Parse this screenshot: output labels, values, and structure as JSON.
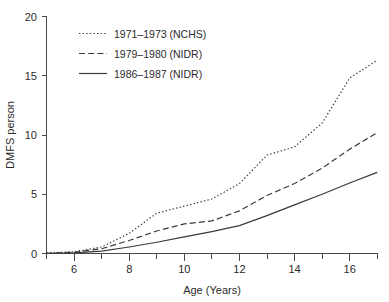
{
  "chart_data": {
    "type": "line",
    "title": "",
    "xlabel": "Age (Years)",
    "ylabel": "DMFS person",
    "xlim": [
      5,
      17
    ],
    "ylim": [
      0,
      20
    ],
    "grid": false,
    "legend_position": "top-left",
    "x_ticks_major": [
      6,
      8,
      10,
      12,
      14,
      16
    ],
    "x_ticks_minor": [
      5,
      7,
      9,
      11,
      13,
      15,
      17
    ],
    "x_tick_labels": [
      "6",
      "8",
      "10",
      "12",
      "14",
      "16"
    ],
    "y_ticks": [
      0,
      5,
      10,
      15,
      20
    ],
    "y_tick_labels": [
      "0",
      "5",
      "10",
      "15",
      "20"
    ],
    "x": [
      5,
      6,
      7,
      8,
      9,
      10,
      11,
      12,
      13,
      14,
      15,
      16,
      17
    ],
    "series": [
      {
        "name": "1971-1973 (NCHS)",
        "style": "dotted",
        "color": "#3a3a3a",
        "values": [
          0.05,
          0.15,
          0.55,
          1.7,
          3.4,
          4.0,
          4.6,
          5.9,
          8.3,
          9.0,
          11.0,
          14.8,
          16.3
        ]
      },
      {
        "name": "1979-1980 (NIDR)",
        "style": "dashed",
        "color": "#3a3a3a",
        "values": [
          0.02,
          0.1,
          0.4,
          1.1,
          1.9,
          2.5,
          2.75,
          3.6,
          4.9,
          5.9,
          7.2,
          8.8,
          10.2
        ]
      },
      {
        "name": "1986-1987 (NIDR)",
        "style": "solid",
        "color": "#3a3a3a",
        "values": [
          0.0,
          0.05,
          0.2,
          0.55,
          0.95,
          1.4,
          1.85,
          2.35,
          3.2,
          4.1,
          5.0,
          5.95,
          6.85
        ]
      }
    ]
  },
  "legend": {
    "entries": [
      {
        "label": "1971–1973 (NCHS)",
        "style": "dotted"
      },
      {
        "label": "1979–1980 (NIDR)",
        "style": "dashed"
      },
      {
        "label": "1986–1987 (NIDR)",
        "style": "solid"
      }
    ]
  },
  "axes": {
    "y_title": "DMFS person",
    "x_title": "Age (Years)",
    "y_labels": [
      "20",
      "15",
      "10",
      "5",
      "0"
    ],
    "x_labels": [
      "6",
      "8",
      "10",
      "12",
      "14",
      "16"
    ]
  },
  "colors": {
    "ink": "#3a3a3a",
    "axis": "#4a4a4a",
    "background": "#ffffff"
  }
}
